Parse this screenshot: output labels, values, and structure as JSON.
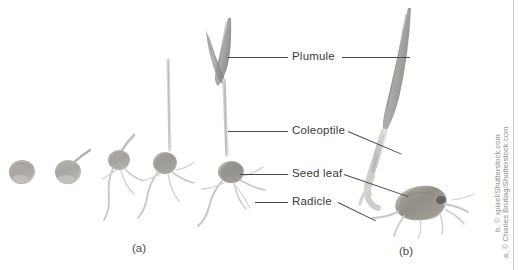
{
  "figure": {
    "kind": "photo-series",
    "background_color": "#ffffff",
    "label_color": "#3a3a3a",
    "leader_color": "#4a4a4a",
    "credit_color": "#8e8e8e",
    "rule_color": "#c9c9c9"
  },
  "labels": [
    {
      "id": "plumule",
      "text": "Plumule",
      "x": 292,
      "y": 51
    },
    {
      "id": "coleoptile",
      "text": "Coleoptile",
      "x": 292,
      "y": 125
    },
    {
      "id": "seed-leaf",
      "text": "Seed leaf",
      "x": 292,
      "y": 168
    },
    {
      "id": "radicle",
      "text": "Radicle",
      "x": 292,
      "y": 196
    }
  ],
  "captions": [
    {
      "id": "panel-a",
      "text": "(a)",
      "x": 132,
      "y": 243
    },
    {
      "id": "panel-b",
      "text": "(b)",
      "x": 399,
      "y": 246
    }
  ],
  "credits": [
    {
      "id": "credit-a",
      "text": "a. © Charles Brutlag/Shutterstock.com"
    },
    {
      "id": "credit-b",
      "text": "b. © xpixel/Shutterstock.com"
    }
  ],
  "panels": [
    {
      "id": "panel-a",
      "label": "(a)",
      "stages": 5,
      "description": "germination sequence left to right"
    },
    {
      "id": "panel-b",
      "label": "(b)",
      "stages": 1,
      "description": "single mature seedling with kernel"
    }
  ]
}
